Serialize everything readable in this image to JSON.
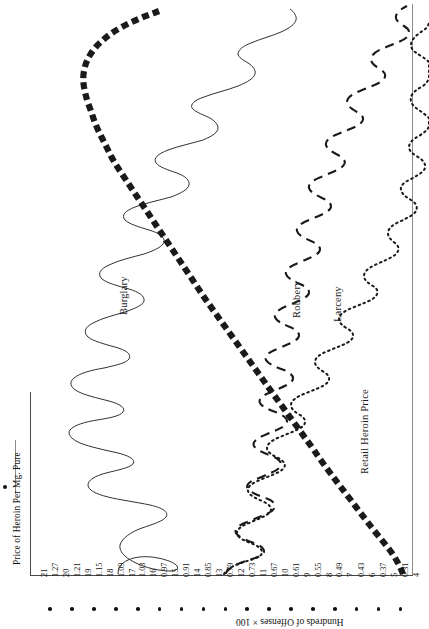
{
  "figure": {
    "orientation": "rotated-90",
    "legend": {
      "marker": "bullet-and-rule",
      "label": "Price of Heroin Per Mg. Pure"
    },
    "axis_bottom_title": "Hundreds of Offenses × 100",
    "curve_labels": {
      "burglary": "Burglary",
      "robbery": "Robbery",
      "larceny": "Larceny",
      "heroin": "Retail Heroin Price"
    }
  },
  "ticks": [
    {
      "offense": "21",
      "price": ""
    },
    {
      "offense": "",
      "price": "1.27"
    },
    {
      "offense": "20",
      "price": ""
    },
    {
      "offense": "",
      "price": "1.21"
    },
    {
      "offense": "19",
      "price": ""
    },
    {
      "offense": "",
      "price": "1.15"
    },
    {
      "offense": "18",
      "price": ""
    },
    {
      "offense": "",
      "price": "1.09"
    },
    {
      "offense": "17",
      "price": ""
    },
    {
      "offense": "",
      "price": "1.03"
    },
    {
      "offense": "16",
      "price": ""
    },
    {
      "offense": "",
      "price": "0.97"
    },
    {
      "offense": "15",
      "price": ""
    },
    {
      "offense": "",
      "price": "0.91"
    },
    {
      "offense": "14",
      "price": ""
    },
    {
      "offense": "",
      "price": "0.85"
    },
    {
      "offense": "13",
      "price": ""
    },
    {
      "offense": "",
      "price": "0.79"
    },
    {
      "offense": "12",
      "price": ""
    },
    {
      "offense": "",
      "price": "0.73"
    },
    {
      "offense": "11",
      "price": ""
    },
    {
      "offense": "",
      "price": "0.67"
    },
    {
      "offense": "10",
      "price": ""
    },
    {
      "offense": "",
      "price": "0.61"
    },
    {
      "offense": "9",
      "price": ""
    },
    {
      "offense": "",
      "price": "0.55"
    },
    {
      "offense": "8",
      "price": ""
    },
    {
      "offense": "",
      "price": "0.49"
    },
    {
      "offense": "7",
      "price": ""
    },
    {
      "offense": "",
      "price": "0.43"
    },
    {
      "offense": "6",
      "price": ""
    },
    {
      "offense": "",
      "price": "0.37"
    },
    {
      "offense": "5",
      "price": ""
    },
    {
      "offense": "",
      "price": "0.31"
    },
    {
      "offense": "4",
      "price": ""
    }
  ],
  "chart_data": {
    "type": "line",
    "title": "",
    "xlabel": "Hundreds of Offenses × 100",
    "ylabel": "Price of Heroin Per Mg. Pure",
    "note": "Figure is printed rotated 90 degrees; the value axis runs along the bottom edge of the page and the time axis runs vertically.",
    "value_axis_offenses": {
      "label": "Hundreds of Offenses × 100",
      "ticks": [
        21,
        20,
        19,
        18,
        17,
        16,
        15,
        14,
        13,
        12,
        11,
        10,
        9,
        8,
        7,
        6,
        5,
        4
      ],
      "range": [
        4,
        21
      ]
    },
    "value_axis_price": {
      "label": "Price of Heroin Per Mg. Pure",
      "ticks": [
        1.27,
        1.21,
        1.15,
        1.09,
        1.03,
        0.97,
        0.91,
        0.85,
        0.79,
        0.73,
        0.67,
        0.61,
        0.55,
        0.49,
        0.43,
        0.37,
        0.31
      ],
      "range": [
        0.31,
        1.27
      ]
    },
    "grid": false,
    "legend_position": "bottom-left",
    "series": [
      {
        "name": "Burglary",
        "style": "thin-solid",
        "axis": "offenses",
        "values": [
          15.6,
          15.5,
          14.9,
          14.2,
          14.0,
          14.4,
          15.0,
          15.6,
          15.9,
          16.1,
          15.9,
          15.4,
          14.8,
          14.3,
          14.0,
          14.2,
          14.6,
          15.1,
          15.4,
          15.2,
          14.6,
          14.0,
          13.6,
          13.7,
          14.2,
          14.8,
          15.2,
          15.0,
          14.4,
          13.8,
          13.5,
          13.8,
          14.4,
          15.0,
          15.3,
          15.0,
          14.3,
          13.6,
          13.2,
          13.5,
          14.1,
          14.8,
          15.2,
          15.0,
          14.2,
          13.4,
          12.9,
          13.1,
          13.8,
          14.6,
          15.0,
          14.7,
          13.9,
          13.1,
          12.6,
          12.8,
          13.5,
          14.2,
          14.6,
          14.3,
          13.5,
          12.7,
          12.2,
          12.4,
          13.1,
          13.8,
          14.2,
          13.9,
          13.1,
          12.3,
          11.8,
          12.0,
          12.7,
          13.4,
          13.8,
          13.5,
          12.7,
          11.9,
          11.4,
          11.6,
          12.3,
          13.0,
          13.4,
          13.1,
          12.3,
          11.5,
          11.0,
          11.2,
          11.9,
          12.6,
          13.0,
          12.8,
          12.1,
          11.4,
          10.9,
          11.0,
          11.6,
          12.2,
          12.5,
          12.2
        ]
      },
      {
        "name": "Robbery",
        "style": "dashed",
        "axis": "offenses",
        "values": [
          9.8,
          9.6,
          9.2,
          8.9,
          9.1,
          9.6,
          10.0,
          9.8,
          9.3,
          8.9,
          8.7,
          9.0,
          9.5,
          9.9,
          9.7,
          9.2,
          8.8,
          8.6,
          8.9,
          9.4,
          9.8,
          9.6,
          9.1,
          8.7,
          8.5,
          8.8,
          9.3,
          9.7,
          9.5,
          9.0,
          8.6,
          8.4,
          8.7,
          9.2,
          9.6,
          9.4,
          8.9,
          8.5,
          8.3,
          8.6,
          9.1,
          9.5,
          9.3,
          8.8,
          8.4,
          8.2,
          8.5,
          9.0,
          9.4,
          9.2,
          8.7,
          8.3,
          8.1,
          8.4,
          8.9,
          9.3,
          9.1,
          8.6,
          8.2,
          8.0,
          8.3,
          8.8,
          9.2,
          9.0,
          8.5,
          8.1,
          7.9,
          8.2,
          8.7,
          9.1,
          8.9,
          8.4,
          8.0,
          7.8,
          8.1,
          8.6,
          9.0,
          8.8,
          8.3,
          7.9,
          7.7,
          8.0,
          8.5,
          8.9,
          8.7,
          8.2,
          7.8,
          7.6,
          7.9,
          8.4,
          8.8,
          8.6,
          8.1,
          7.7,
          7.5,
          7.8,
          8.3,
          8.7,
          8.5,
          8.0
        ]
      },
      {
        "name": "Larceny",
        "style": "dotted",
        "axis": "offenses",
        "values": [
          7.9,
          7.6,
          7.3,
          7.5,
          8.0,
          8.4,
          8.2,
          7.7,
          7.3,
          7.1,
          7.4,
          7.9,
          8.3,
          8.1,
          7.6,
          7.2,
          7.0,
          7.3,
          7.8,
          8.2,
          8.0,
          7.5,
          7.1,
          6.9,
          7.2,
          7.7,
          8.1,
          7.9,
          7.4,
          7.0,
          6.8,
          7.1,
          7.6,
          8.0,
          7.8,
          7.3,
          6.9,
          6.7,
          7.0,
          7.5,
          7.9,
          7.7,
          7.2,
          6.8,
          6.6,
          6.9,
          7.4,
          7.8,
          7.6,
          7.1,
          6.7,
          6.5,
          6.8,
          7.3,
          7.7,
          7.5,
          7.0,
          6.6,
          6.4,
          6.7,
          7.2,
          7.6,
          7.4,
          6.9,
          6.5,
          6.3,
          6.6,
          7.1,
          7.5,
          7.3,
          6.8,
          6.4,
          6.2,
          6.5,
          7.0,
          7.4,
          7.2,
          6.7,
          6.3,
          6.1,
          6.4,
          6.9,
          7.3,
          7.1,
          6.6,
          6.2,
          6.0,
          6.3,
          6.8,
          7.2,
          7.0,
          6.5,
          6.1,
          5.9,
          6.2,
          6.7,
          7.1,
          6.9,
          6.4,
          6.0
        ]
      },
      {
        "name": "Retail Heroin Price",
        "style": "thick-dashed",
        "axis": "price",
        "values": [
          1.21,
          1.22,
          1.23,
          1.24,
          1.25,
          1.25,
          1.25,
          1.24,
          1.23,
          1.21,
          1.18,
          1.15,
          1.12,
          1.09,
          1.06,
          1.03,
          1.0,
          0.98,
          0.96,
          0.95,
          0.94,
          0.93,
          0.92,
          0.91,
          0.9,
          0.89,
          0.88,
          0.87,
          0.86,
          0.85,
          0.84,
          0.83,
          0.82,
          0.81,
          0.8,
          0.79,
          0.78,
          0.77,
          0.76,
          0.75,
          0.74,
          0.73,
          0.72,
          0.71,
          0.7,
          0.69,
          0.68,
          0.67,
          0.66,
          0.65,
          0.64,
          0.63,
          0.62,
          0.61,
          0.6,
          0.59,
          0.58,
          0.57,
          0.56,
          0.55,
          0.54,
          0.53,
          0.52,
          0.51,
          0.5,
          0.49,
          0.48,
          0.47,
          0.46,
          0.45,
          0.44,
          0.43,
          0.42,
          0.41,
          0.4,
          0.4,
          0.39,
          0.39,
          0.38,
          0.38,
          0.37,
          0.37,
          0.36,
          0.36,
          0.35,
          0.35,
          0.35,
          0.34,
          0.34,
          0.34,
          0.33,
          0.33,
          0.33,
          0.32,
          0.32,
          0.32,
          0.32,
          0.31,
          0.31,
          0.31
        ]
      }
    ]
  }
}
